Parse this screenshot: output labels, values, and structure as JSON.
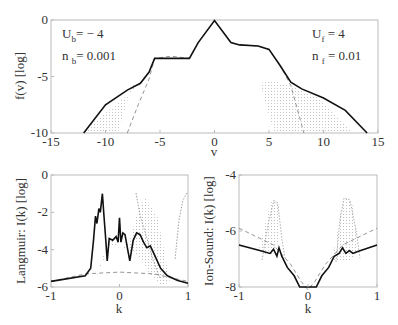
{
  "chart_data": [
    {
      "type": "line",
      "panel": "top",
      "title": "",
      "xlabel": "v",
      "ylabel": "f(v) [log]",
      "xlim": [
        -15,
        15
      ],
      "ylim": [
        -10,
        0
      ],
      "xticks": [
        "-15",
        "-10",
        "-5",
        "0",
        "5",
        "10",
        "15"
      ],
      "yticks": [
        "0",
        "-5",
        "-10"
      ],
      "annotations": [
        {
          "text": "U",
          "sub": "b",
          "rest": "= − 4",
          "position": "top-left"
        },
        {
          "text": "n",
          "sub": "b",
          "rest": "= 0.001",
          "position": "top-left"
        },
        {
          "text": "U",
          "sub": "f",
          "rest": "= 4",
          "position": "top-right"
        },
        {
          "text": "n",
          "sub": "f",
          "rest": "= 0.01",
          "position": "top-right"
        }
      ],
      "series": [
        {
          "name": "final (solid)",
          "style": "solid",
          "x": [
            -12,
            -10,
            -8,
            -6.8,
            -6,
            -5.5,
            -4,
            -2.3,
            -1.5,
            0,
            1.5,
            2.3,
            4,
            5,
            6,
            7,
            8,
            10,
            12,
            14
          ],
          "y": [
            -10,
            -7.5,
            -6.2,
            -5.6,
            -4.6,
            -3.4,
            -3.4,
            -3.4,
            -2,
            -0.05,
            -2,
            -2.2,
            -2.3,
            -2.6,
            -4,
            -5.5,
            -6.1,
            -6.9,
            -8,
            -10
          ]
        },
        {
          "name": "initial (dashed)",
          "style": "dashed",
          "x": [
            -8,
            -7,
            -6,
            -5.5,
            -4,
            -2.3,
            -1.5,
            0,
            1.5,
            2.3,
            4,
            5,
            6,
            7,
            8.2
          ],
          "y": [
            -10,
            -7.5,
            -5.2,
            -3.4,
            -3.2,
            -3.4,
            -2,
            -0.05,
            -2,
            -2.2,
            -2.3,
            -2.6,
            -4,
            -5.8,
            -10
          ]
        }
      ]
    },
    {
      "type": "line",
      "panel": "bottom-left",
      "xlabel": "k",
      "ylabel": "Langmuir: I(k) [log]",
      "xlim": [
        -1,
        1
      ],
      "ylim": [
        -6,
        0
      ],
      "xticks": [
        "-1",
        "0",
        "1"
      ],
      "yticks": [
        "0",
        "-2",
        "-4",
        "-6"
      ],
      "series": [
        {
          "name": "final (solid)",
          "style": "solid",
          "x": [
            -1,
            -0.5,
            -0.42,
            -0.38,
            -0.35,
            -0.33,
            -0.3,
            -0.28,
            -0.25,
            -0.23,
            -0.2,
            -0.18,
            -0.15,
            -0.1,
            -0.05,
            -0.02,
            0,
            0.02,
            0.05,
            0.08,
            0.12,
            0.15,
            0.2,
            0.25,
            0.3,
            0.35,
            0.4,
            0.45,
            0.5,
            0.6,
            0.7,
            0.85,
            1
          ],
          "y": [
            -5.7,
            -5.4,
            -5.0,
            -3.5,
            -2.2,
            -2.6,
            -1.8,
            -2.0,
            -1.0,
            -2.0,
            -3.5,
            -4.6,
            -3.4,
            -3.5,
            -3.3,
            -3.6,
            -2.3,
            -3.6,
            -3.1,
            -3.2,
            -4.0,
            -4.6,
            -3.5,
            -3.1,
            -3.2,
            -3.6,
            -3.9,
            -3.8,
            -4.2,
            -5.0,
            -5.4,
            -5.65,
            -5.8
          ]
        },
        {
          "name": "initial (dashed)",
          "style": "dashed",
          "x": [
            -1,
            -0.5,
            0,
            0.5,
            1
          ],
          "y": [
            -5.7,
            -5.3,
            -5.2,
            -5.3,
            -5.7
          ]
        }
      ]
    },
    {
      "type": "line",
      "panel": "bottom-right",
      "xlabel": "k",
      "ylabel": "Ion-Sound: I(k) [log]",
      "xlim": [
        -1,
        1
      ],
      "ylim": [
        -8,
        -4
      ],
      "xticks": [
        "-1",
        "0",
        "1"
      ],
      "yticks": [
        "-4",
        "-6",
        "-8"
      ],
      "series": [
        {
          "name": "final (solid)",
          "style": "solid",
          "x": [
            -1,
            -0.7,
            -0.55,
            -0.5,
            -0.45,
            -0.42,
            -0.38,
            -0.3,
            -0.2,
            -0.12,
            -0.08,
            0.08,
            0.12,
            0.2,
            0.3,
            0.38,
            0.45,
            0.5,
            0.55,
            0.6,
            0.65,
            0.7,
            1
          ],
          "y": [
            -6.5,
            -6.7,
            -6.8,
            -6.65,
            -6.9,
            -6.6,
            -6.9,
            -7.3,
            -7.6,
            -8.0,
            -8.0,
            -8.0,
            -8.0,
            -7.6,
            -7.3,
            -6.9,
            -6.8,
            -6.6,
            -6.8,
            -6.7,
            -6.8,
            -6.75,
            -6.5
          ]
        },
        {
          "name": "initial (dashed)",
          "style": "dashed",
          "x": [
            -1,
            -0.5,
            -0.25,
            -0.1,
            0,
            0.1,
            0.25,
            0.5,
            1
          ],
          "y": [
            -5.9,
            -6.5,
            -7.2,
            -7.8,
            -8.1,
            -7.8,
            -7.2,
            -6.5,
            -5.9
          ]
        }
      ]
    }
  ]
}
